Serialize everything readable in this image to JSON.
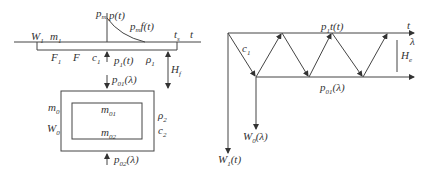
{
  "left_diagram": {
    "labels": {
      "W1": {
        "main": "W",
        "sub": "1"
      },
      "m1": {
        "main": "m",
        "sub": "1"
      },
      "pm": {
        "main": "p",
        "sub": "m"
      },
      "pt": "p(t)",
      "pmft": {
        "main": "p",
        "sub": "m",
        "rest": "f(t)"
      },
      "ts": {
        "main": "t",
        "sub": "s"
      },
      "t": "t",
      "F1": {
        "main": "F",
        "sub": "1"
      },
      "F": "F",
      "c1": {
        "main": "c",
        "sub": "1"
      },
      "p1t": {
        "main": "p",
        "sub": "1",
        "rest": "(t)"
      },
      "rho1": {
        "main": "ρ",
        "sub": "1"
      },
      "Hf": {
        "main": "H",
        "sub": "f"
      },
      "p01": {
        "main": "p",
        "sub": "01",
        "rest": "(λ)"
      },
      "m0": {
        "main": "m",
        "sub": "0"
      },
      "W0": {
        "main": "W",
        "sub": "0"
      },
      "m01": {
        "main": "m",
        "sub": "01"
      },
      "m02": {
        "main": "m",
        "sub": "02"
      },
      "rho2": {
        "main": "ρ",
        "sub": "2"
      },
      "c2": {
        "main": "c",
        "sub": "2"
      },
      "p02": {
        "main": "p",
        "sub": "02",
        "rest": "(λ)"
      }
    }
  },
  "right_diagram": {
    "labels": {
      "p1tt": {
        "main": "p",
        "sub": "1",
        "rest": "t(t)"
      },
      "t": "t",
      "lambda": "λ",
      "c1": {
        "main": "c",
        "sub": "1"
      },
      "He": {
        "main": "H",
        "sub": "e"
      },
      "p01": {
        "main": "p",
        "sub": "01",
        "rest": "(λ)"
      },
      "W0": {
        "main": "W",
        "sub": "0",
        "rest": "(λ)"
      },
      "W1": {
        "main": "W",
        "sub": "1",
        "rest": "(t)"
      }
    }
  }
}
